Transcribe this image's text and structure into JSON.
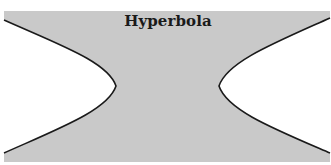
{
  "figure": {
    "title": "Hyperbola",
    "colors": {
      "page_background": "#ffffff",
      "region_fill": "#c9c9c9",
      "curve_stroke": "#1a1a1a",
      "inside_branch_fill": "#ffffff"
    },
    "box": {
      "x": 4,
      "y": 11,
      "width": 326,
      "height": 151
    },
    "branches": [
      {
        "name": "left-branch",
        "top_end": [
          4,
          20
        ],
        "vertex": [
          116,
          86
        ],
        "bottom_end": [
          4,
          153
        ]
      },
      {
        "name": "right-branch",
        "top_end": [
          330,
          18
        ],
        "vertex": [
          219,
          86
        ],
        "bottom_end": [
          330,
          153
        ]
      }
    ]
  }
}
